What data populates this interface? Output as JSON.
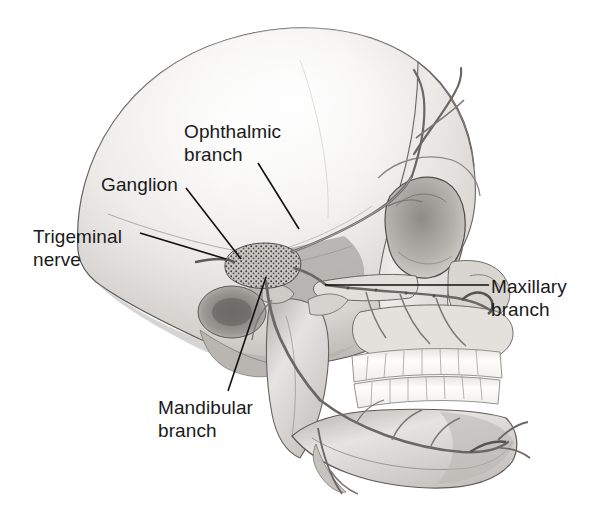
{
  "figure": {
    "view": "lateral (left side) human skull",
    "background_color": "#ffffff",
    "ink_color": "#1a1a1a",
    "bone_tone_light": "#f2f1ef",
    "bone_tone_mid": "#c9c7c4",
    "bone_tone_dark": "#8d8b88",
    "nerve_tone": "#6e6c69",
    "tooth_tone": "#fdfdfc"
  },
  "labels": [
    {
      "id": "ophthalmic",
      "name": "ophthalmic-branch-label",
      "text": "Ophthalmic\nbranch",
      "leader": {
        "from_x": 258,
        "from_y": 163,
        "to_x": 299,
        "to_y": 229
      }
    },
    {
      "id": "ganglion",
      "name": "ganglion-label",
      "text": "Ganglion",
      "leader": {
        "from_x": 186,
        "from_y": 188,
        "to_x": 241,
        "to_y": 259
      }
    },
    {
      "id": "trigeminal",
      "name": "trigeminal-nerve-label",
      "text": "Trigeminal\nnerve",
      "leader": {
        "from_x": 140,
        "from_y": 233,
        "to_x": 226,
        "to_y": 259
      }
    },
    {
      "id": "mandibular",
      "name": "mandibular-branch-label",
      "text": "Mandibular\nbranch",
      "leader": {
        "from_x": 266,
        "from_y": 277,
        "to_x": 228,
        "to_y": 391
      }
    },
    {
      "id": "maxillary",
      "name": "maxillary-branch-label",
      "text": "Maxillary\nbranch",
      "leader": {
        "from_x": 489,
        "from_y": 285,
        "to_x": 325,
        "to_y": 285
      }
    }
  ],
  "anatomy_parts": [
    {
      "name": "cranial-vault",
      "description": "rounded neurocranium occupying left two thirds of image"
    },
    {
      "name": "frontal-bone",
      "description": "forehead with supraorbital nerve branches"
    },
    {
      "name": "orbit",
      "description": "eye socket, right of centre"
    },
    {
      "name": "zygomatic-arch",
      "description": "cheek bone arch below orbit"
    },
    {
      "name": "maxilla",
      "description": "upper jaw carrying upper teeth"
    },
    {
      "name": "mandible",
      "description": "lower jaw carrying lower teeth"
    },
    {
      "name": "upper-teeth",
      "description": "row of upper dentition"
    },
    {
      "name": "lower-teeth",
      "description": "row of lower dentition"
    },
    {
      "name": "trigeminal-ganglion",
      "description": "stippled semilunar ganglion at skull centre"
    },
    {
      "name": "ophthalmic-nerve",
      "description": "V1 running forward over orbit to forehead"
    },
    {
      "name": "maxillary-nerve",
      "description": "V2 running forward into maxilla region"
    },
    {
      "name": "mandibular-nerve",
      "description": "V3 descending into mandible"
    },
    {
      "name": "mental-nerve",
      "description": "terminal branch exiting at chin"
    },
    {
      "name": "external-acoustic-meatus",
      "description": "ear opening shadow behind jaw joint"
    }
  ]
}
